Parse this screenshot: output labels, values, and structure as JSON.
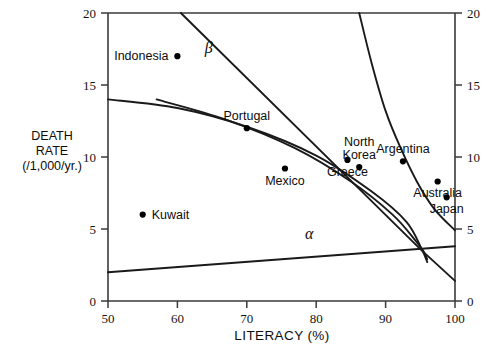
{
  "chart_data": {
    "type": "scatter",
    "title": "",
    "xlabel": "LITERACY (%)",
    "ylabel": "DEATH RATE (/1,000/yr.)",
    "ylabel_lines": [
      "DEATH",
      "RATE",
      "(/1,000/yr.)"
    ],
    "xlim": [
      50,
      100
    ],
    "ylim": [
      0,
      20
    ],
    "xticks": [
      50,
      60,
      70,
      80,
      90,
      100
    ],
    "yticks": [
      0,
      5,
      10,
      15,
      20
    ],
    "xtick_labels": [
      "50",
      "60",
      "70",
      "80",
      "90",
      "100"
    ],
    "ytick_labels": [
      "0",
      "5",
      "10",
      "15",
      "20"
    ],
    "right_axis": true,
    "right_ytick_labels": [
      "0",
      "5",
      "10",
      "15",
      "20"
    ],
    "grid": false,
    "legend": "none",
    "points": [
      {
        "name": "Indonesia",
        "x": 60.0,
        "y": 17.0,
        "label_pos": "left"
      },
      {
        "name": "Portugal",
        "x": 70.0,
        "y": 12.0,
        "label_pos": "above"
      },
      {
        "name": "Kuwait",
        "x": 55.0,
        "y": 6.0,
        "label_pos": "right"
      },
      {
        "name": "Mexico",
        "x": 75.5,
        "y": 9.2,
        "label_pos": "below"
      },
      {
        "name": "Greece",
        "x": 84.5,
        "y": 9.8,
        "label_pos": "below"
      },
      {
        "name": "North Korea",
        "x": 86.2,
        "y": 9.3,
        "label_pos": "above"
      },
      {
        "name": "Argentina",
        "x": 92.5,
        "y": 9.7,
        "label_pos": "above"
      },
      {
        "name": "Australia",
        "x": 97.5,
        "y": 8.3,
        "label_pos": "below"
      },
      {
        "name": "Japan",
        "x": 98.8,
        "y": 7.2,
        "label_pos": "below"
      }
    ],
    "annotations": [
      {
        "text": "β",
        "x": 64.5,
        "y": 17.2,
        "name": "beta-label"
      },
      {
        "text": "α",
        "x": 79.0,
        "y": 4.3,
        "name": "alpha-label"
      }
    ],
    "series": [
      {
        "name": "beta-line",
        "kind": "line",
        "points": [
          [
            60.5,
            20.0
          ],
          [
            95.0,
            3.6
          ],
          [
            100.0,
            1.4
          ]
        ]
      },
      {
        "name": "alpha-line",
        "kind": "line",
        "points": [
          [
            50.0,
            2.0
          ],
          [
            100.0,
            3.8
          ]
        ]
      },
      {
        "name": "upper-curve",
        "kind": "curve",
        "points": [
          [
            50.0,
            14.0
          ],
          [
            60.0,
            13.4
          ],
          [
            70.0,
            12.1
          ],
          [
            80.0,
            10.1
          ],
          [
            88.0,
            7.6
          ],
          [
            93.0,
            5.5
          ],
          [
            95.2,
            3.6
          ],
          [
            96.0,
            2.7
          ]
        ]
      },
      {
        "name": "lower-curve",
        "kind": "curve",
        "points": [
          [
            57.0,
            14.0
          ],
          [
            67.0,
            12.6
          ],
          [
            77.0,
            10.6
          ],
          [
            85.0,
            8.3
          ],
          [
            91.0,
            6.0
          ],
          [
            94.3,
            4.2
          ],
          [
            95.4,
            3.5
          ],
          [
            96.0,
            2.9
          ]
        ]
      },
      {
        "name": "steep-curve",
        "kind": "curve",
        "points": [
          [
            86.2,
            20.0
          ],
          [
            88.0,
            16.5
          ],
          [
            90.0,
            13.2
          ],
          [
            92.0,
            10.8
          ],
          [
            94.5,
            8.3
          ],
          [
            97.0,
            6.4
          ],
          [
            100.0,
            4.9
          ]
        ]
      }
    ]
  },
  "plot": {
    "left_px": 108,
    "right_px": 455,
    "top_px": 13,
    "bottom_px": 301
  }
}
